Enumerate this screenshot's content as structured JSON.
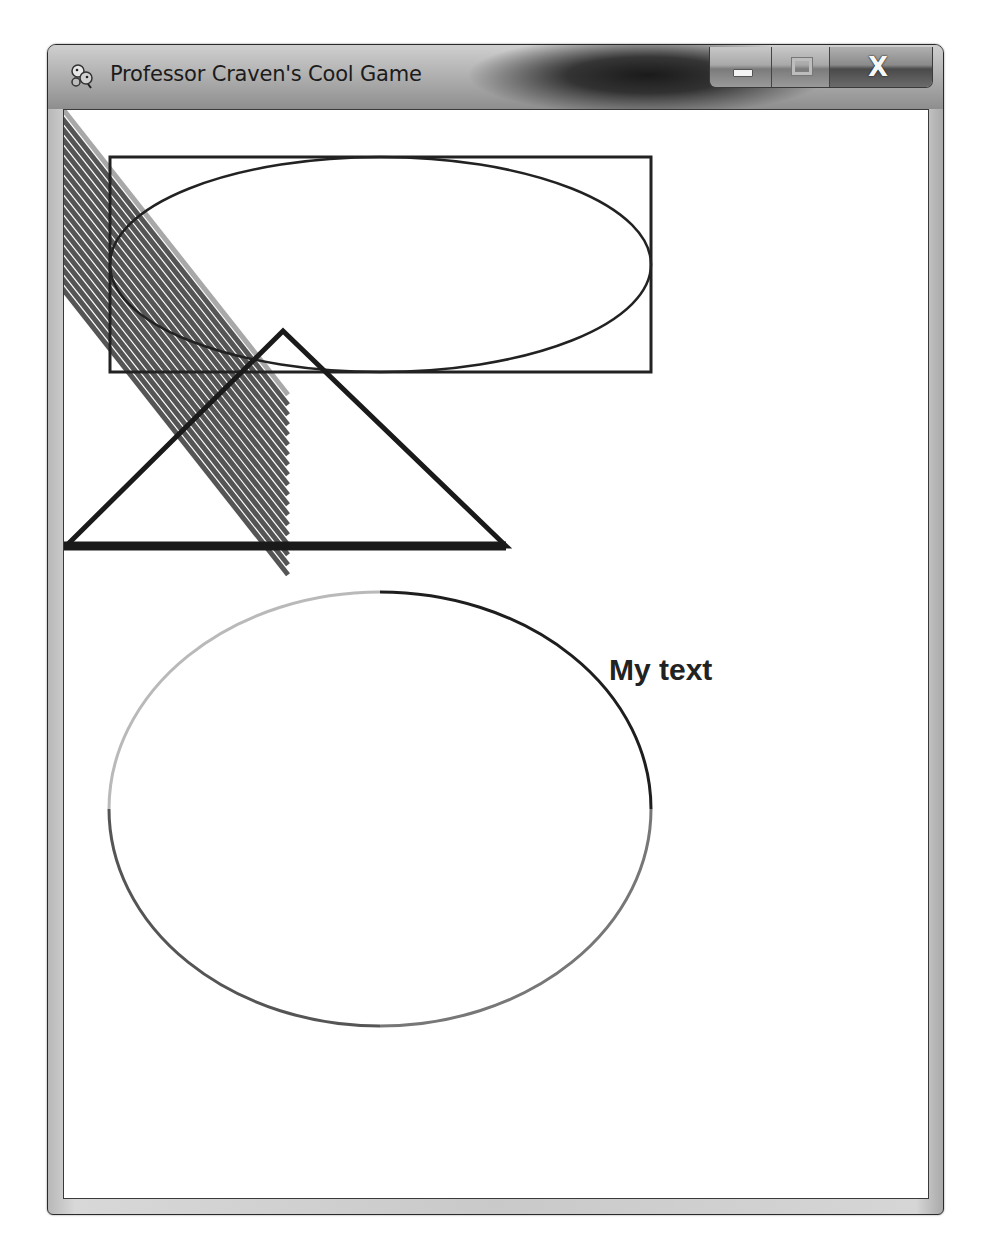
{
  "window": {
    "title": "Professor Craven's Cool Game",
    "app_icon": "pygame-snake-icon",
    "caption_buttons": {
      "minimize_icon": "minimize-icon",
      "maximize_icon": "maximize-icon",
      "close_label": "X"
    }
  },
  "canvas": {
    "background": "#ffffff",
    "width": 866,
    "height": 1090,
    "hatch_lines": {
      "count": 19,
      "first_color": "#a8a8a8",
      "color": "#555555",
      "spacing": 10,
      "width": 5,
      "end_x": 224
    },
    "rectangle": {
      "x": 46,
      "y": 47,
      "w": 541,
      "h": 215,
      "stroke": "#222222",
      "stroke_width": 3
    },
    "ellipse": {
      "cx": 316.5,
      "cy": 154.5,
      "rx": 270.5,
      "ry": 107.5,
      "stroke": "#222222",
      "stroke_width": 2.5
    },
    "triangle": {
      "points": [
        [
          219,
          221
        ],
        [
          2,
          436
        ],
        [
          442,
          436
        ]
      ],
      "stroke": "#1a1a1a",
      "stroke_width": 5
    },
    "triangle_base": {
      "x1": 0,
      "y1": 436,
      "x2": 442,
      "y2": 436,
      "stroke_width": 9
    },
    "circle_arcs": {
      "cx": 316,
      "cy": 699,
      "rx": 271,
      "ry": 217,
      "upper_left_color": "#b9b9b9",
      "upper_right_color": "#1e1e1e",
      "lower_left_color": "#555555",
      "lower_right_color": "#777777"
    },
    "text": {
      "value": "My text",
      "color": "#222222"
    }
  }
}
